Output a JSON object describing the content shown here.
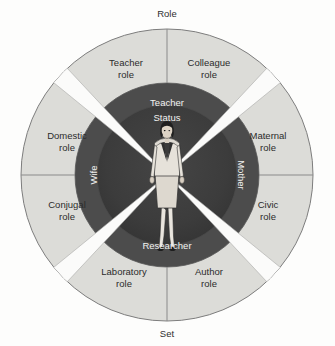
{
  "figure": {
    "axis_labels": {
      "top": "Role",
      "bottom": "Set"
    },
    "center": {
      "status_label": "Status",
      "figure_description": "woman-standing-icon"
    },
    "status_ring": {
      "name": "status-ring",
      "labels": [
        {
          "id": "teacher",
          "text": "Teacher",
          "position": "top"
        },
        {
          "id": "mother",
          "text": "Mother",
          "position": "right"
        },
        {
          "id": "researcher",
          "text": "Researcher",
          "position": "bottom"
        },
        {
          "id": "wife",
          "text": "Wife",
          "position": "left"
        }
      ]
    },
    "role_ring": {
      "name": "role-ring",
      "sectors": [
        {
          "id": "teacher-role",
          "line1": "Teacher",
          "line2": "role",
          "quadrant": "top-left"
        },
        {
          "id": "colleague-role",
          "line1": "Colleague",
          "line2": "role",
          "quadrant": "top-right"
        },
        {
          "id": "maternal-role",
          "line1": "Maternal",
          "line2": "role",
          "quadrant": "right-upper"
        },
        {
          "id": "civic-role",
          "line1": "Civic",
          "line2": "role",
          "quadrant": "right-lower"
        },
        {
          "id": "author-role",
          "line1": "Author",
          "line2": "role",
          "quadrant": "bottom-right"
        },
        {
          "id": "laboratory-role",
          "line1": "Laboratory",
          "line2": "role",
          "quadrant": "bottom-left"
        },
        {
          "id": "conjugal-role",
          "line1": "Conjugal",
          "line2": "role",
          "quadrant": "left-lower"
        },
        {
          "id": "domestic-role",
          "line1": "Domestic",
          "line2": "role",
          "quadrant": "left-upper"
        }
      ]
    },
    "colors": {
      "background": "#fdfdfc",
      "outer_ring": "#dcdcd8",
      "mid_ring": "#4c4c4c",
      "inner_ring": "#3a3a3a",
      "wedge": "#fbfbfa",
      "stroke": "#7d7d7d",
      "light_text": "#f2f2f0",
      "dark_text": "#2b2b2b"
    },
    "geometry": {
      "center_x": 167,
      "center_y": 175,
      "r_outer": 146,
      "r_mid": 92,
      "r_inner": 70,
      "wedge_half_angle_deg": 5.5
    }
  }
}
